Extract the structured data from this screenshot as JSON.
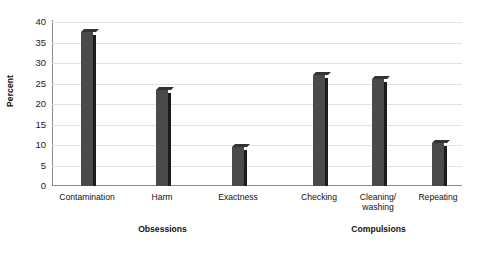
{
  "chart_data": {
    "type": "bar",
    "title": "",
    "xlabel": "",
    "ylabel": "Percent",
    "ylim": [
      0,
      40
    ],
    "yticks": [
      0,
      5,
      10,
      15,
      20,
      25,
      30,
      35,
      40
    ],
    "ytick_labels": [
      "0",
      "5",
      "10",
      "15",
      "20",
      "25",
      "30",
      "35",
      "40"
    ],
    "grid": "horizontal",
    "legend": "none",
    "bar_color": "#4a4a4a",
    "bar_shadow_color": "#1c1c1c",
    "gridline_color": "#e2e2e2",
    "axis_color": "#8a8a8a",
    "categories": [
      "Contamination",
      "Harm",
      "Exactness",
      "Checking",
      "Cleaning/\nwashing",
      "Repeating"
    ],
    "values": [
      37.5,
      23.5,
      9.5,
      27,
      26,
      10.5
    ],
    "groups": [
      {
        "label": "Obsessions",
        "categories": [
          "Contamination",
          "Harm",
          "Exactness"
        ]
      },
      {
        "label": "Compulsions",
        "categories": [
          "Checking",
          "Cleaning/\nwashing",
          "Repeating"
        ]
      }
    ]
  }
}
